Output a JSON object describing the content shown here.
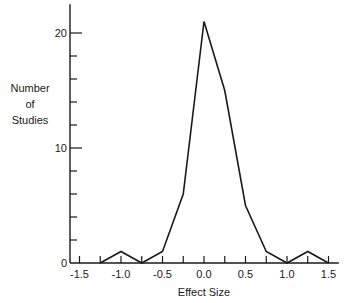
{
  "chart_data": {
    "type": "line",
    "title": "",
    "xlabel": "Effect Size",
    "ylabel": [
      "Number",
      "of",
      "Studies"
    ],
    "x": [
      -1.25,
      -1.0,
      -0.75,
      -0.5,
      -0.25,
      0.0,
      0.25,
      0.5,
      0.75,
      1.0,
      1.25,
      1.5
    ],
    "values": [
      0,
      1,
      0,
      1,
      6,
      21,
      15,
      5,
      1,
      0,
      1,
      0
    ],
    "xlim": [
      -1.625,
      1.625
    ],
    "ylim": [
      0,
      22.5
    ],
    "x_ticks": [
      -1.5,
      -1.25,
      -1.0,
      -0.75,
      -0.5,
      -0.25,
      0.0,
      0.25,
      0.5,
      0.75,
      1.0,
      1.25,
      1.5
    ],
    "x_tick_labels": [
      {
        "value": -1.5,
        "label": "-1.5"
      },
      {
        "value": -1.0,
        "label": "-1.0"
      },
      {
        "value": -0.5,
        "label": "-0.5"
      },
      {
        "value": 0.0,
        "label": "0.0"
      },
      {
        "value": 0.5,
        "label": "0.5"
      },
      {
        "value": 1.0,
        "label": "1.0"
      },
      {
        "value": 1.5,
        "label": "1.5"
      }
    ],
    "y_ticks": [
      2,
      4,
      6,
      8,
      10,
      12,
      14,
      16,
      18,
      20
    ],
    "y_tick_labels": [
      {
        "value": 0,
        "label": "0"
      },
      {
        "value": 10,
        "label": "10"
      },
      {
        "value": 20,
        "label": "20"
      }
    ],
    "grid": false,
    "legend": null
  }
}
